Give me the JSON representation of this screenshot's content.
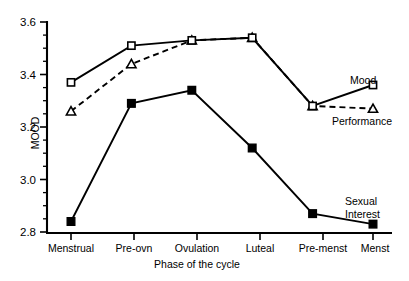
{
  "chart_data": {
    "type": "line",
    "title": "",
    "xlabel": "Phase of the cycle",
    "ylabel": "MOOD",
    "categories": [
      "Menstrual",
      "Pre-ovn",
      "Ovulation",
      "Luteal",
      "Pre-menst",
      "Menst"
    ],
    "ylim": [
      2.8,
      3.6
    ],
    "yticks": [
      2.8,
      3.0,
      3.2,
      3.4,
      3.6
    ],
    "ytick_labels": [
      "2.8",
      "3.0",
      "3.2",
      "3.4",
      "3.6"
    ],
    "minor_tick_interval": 0.05,
    "grid": false,
    "legend_position": "inline-right-labels",
    "series": [
      {
        "name": "Mood",
        "values": [
          3.37,
          3.51,
          3.53,
          3.54,
          3.28,
          3.36
        ],
        "marker": "open-square",
        "line_style": "solid",
        "color": "#000000"
      },
      {
        "name": "Performance",
        "values": [
          3.26,
          3.44,
          3.53,
          3.54,
          3.28,
          3.27
        ],
        "marker": "open-triangle",
        "line_style": "dashed",
        "color": "#000000"
      },
      {
        "name": "Sexual Interest",
        "values": [
          2.84,
          3.29,
          3.34,
          3.12,
          2.87,
          2.83
        ],
        "marker": "filled-square",
        "line_style": "solid",
        "color": "#000000"
      }
    ]
  },
  "axis": {
    "y_label": "MOOD",
    "x_label": "Phase of the cycle",
    "y_tick_0": "2.8",
    "y_tick_1": "3.0",
    "y_tick_2": "3.2",
    "y_tick_3": "3.4",
    "y_tick_4": "3.6",
    "cat_0": "Menstrual",
    "cat_1": "Pre-ovn",
    "cat_2": "Ovulation",
    "cat_3": "Luteal",
    "cat_4": "Pre-menst",
    "cat_5": "Menst"
  },
  "labels": {
    "mood": "Mood",
    "performance": "Performance",
    "sexual_line1": "Sexual",
    "sexual_line2": "Interest"
  }
}
